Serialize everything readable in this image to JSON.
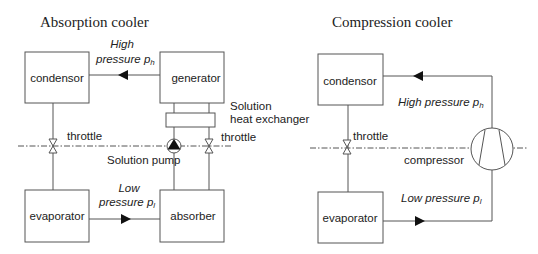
{
  "absorption": {
    "title": "Absorption cooler",
    "condensor": "condensor",
    "generator": "generator",
    "evaporator": "evaporator",
    "absorber": "absorber",
    "high_pressure_line1": "High",
    "high_pressure_line2": "pressure p",
    "high_pressure_sub": "h",
    "low_pressure_line1": "Low",
    "low_pressure_line2": "pressure p",
    "low_pressure_sub": "l",
    "throttle_left": "throttle",
    "throttle_right": "throttle",
    "pump": "Solution  pump",
    "hx_line1": "Solution",
    "hx_line2": "heat exchanger"
  },
  "compression": {
    "title": "Compression cooler",
    "condensor": "condensor",
    "evaporator": "evaporator",
    "high_pressure": "High pressure p",
    "high_pressure_sub": "h",
    "low_pressure": "Low pressure p",
    "low_pressure_sub": "l",
    "throttle": "throttle",
    "compressor": "compressor"
  }
}
